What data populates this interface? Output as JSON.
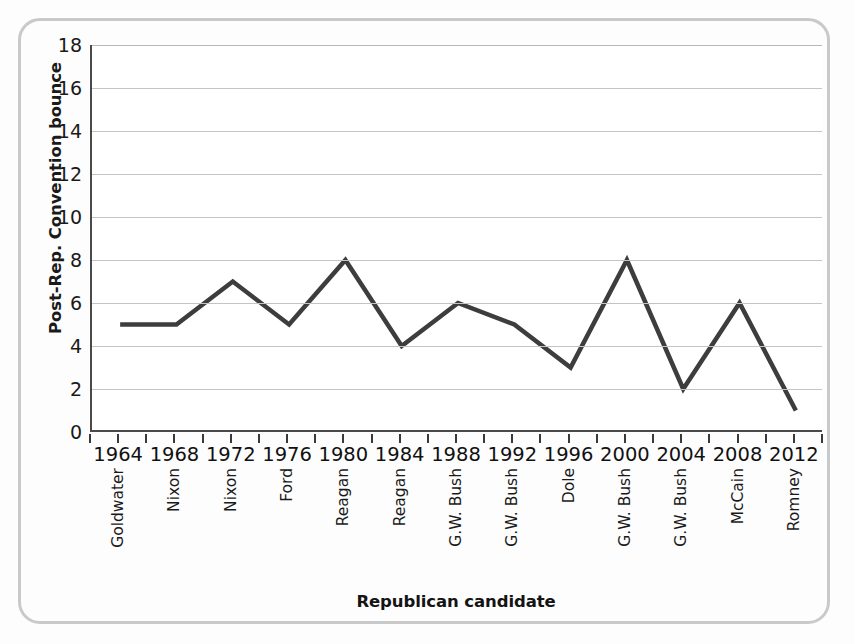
{
  "chart_data": {
    "type": "line",
    "title": "",
    "xlabel": "Republican candidate",
    "ylabel": "Post-Rep. Convention bounce",
    "x": [
      1964,
      1968,
      1972,
      1976,
      1980,
      1984,
      1988,
      1992,
      1996,
      2000,
      2004,
      2008,
      2012
    ],
    "categories": [
      "1964",
      "1968",
      "1972",
      "1976",
      "1980",
      "1984",
      "1988",
      "1992",
      "1996",
      "2000",
      "2004",
      "2008",
      "2012"
    ],
    "candidates": [
      "Goldwater",
      "Nixon",
      "Nixon",
      "Ford",
      "Reagan",
      "Reagan",
      "G.W. Bush",
      "G.W. Bush",
      "Dole",
      "G.W. Bush",
      "G.W. Bush",
      "McCain",
      "Romney"
    ],
    "values": [
      5,
      5,
      7,
      5,
      8,
      4,
      6,
      5,
      3,
      8,
      2,
      6,
      1
    ],
    "ylim": [
      0,
      18
    ],
    "y_ticks": [
      0,
      2,
      4,
      6,
      8,
      10,
      12,
      14,
      16,
      18
    ],
    "xlim": [
      1962,
      2014
    ],
    "grid": true,
    "legend": null,
    "line_color": "#3d3d3d",
    "line_width": 4.5,
    "axis_color": "#4a4a4a",
    "gridline_color": "#c4c4c4",
    "frame_color": "#c9c9c9",
    "background_color": "#fdfdfd",
    "plot_background_color": "#ffffff"
  }
}
